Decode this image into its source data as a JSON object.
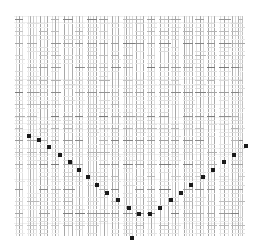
{
  "figure": {
    "title": "",
    "background_color": "#ffffff",
    "width": 255,
    "height": 250
  },
  "plot": {
    "left": 14,
    "top": 16,
    "width": 228,
    "height": 220,
    "grid": false,
    "axis_visible": false,
    "tick_labels_visible": false
  },
  "colors": {
    "background": "#ffffff",
    "marker": "#1a1a1a",
    "line_dark": "#8a8a8a",
    "line_mid": "#b4b4b4",
    "line_light": "#d8d8d8",
    "tick_dark": "#6e6e6e",
    "tick_mid": "#a8a8a8",
    "tick_light": "#d0d0d0"
  },
  "chart_data": {
    "type": "scatter",
    "title": "",
    "subtitle": "",
    "xlabel": "",
    "ylabel": "",
    "xlim": [
      0,
      228
    ],
    "ylim": [
      0,
      220
    ],
    "grid": false,
    "legend": null,
    "annotations": [],
    "background_columns": [
      {
        "x": 2,
        "lines": [
          0,
          3,
          6
        ],
        "weights": [
          0.35,
          0.9,
          0.3
        ]
      },
      {
        "x": 14,
        "lines": [
          0,
          2,
          5,
          8
        ],
        "weights": [
          0.25,
          0.8,
          0.5,
          0.3
        ]
      },
      {
        "x": 26,
        "lines": [
          0,
          4,
          7
        ],
        "weights": [
          0.9,
          0.35,
          0.85
        ]
      },
      {
        "x": 38,
        "lines": [
          0,
          3,
          6
        ],
        "weights": [
          0.3,
          0.85,
          0.3
        ]
      },
      {
        "x": 50,
        "lines": [
          0,
          4,
          8
        ],
        "weights": [
          0.85,
          0.4,
          0.8
        ]
      },
      {
        "x": 62,
        "lines": [
          0,
          3,
          6
        ],
        "weights": [
          0.3,
          0.85,
          0.35
        ]
      },
      {
        "x": 74,
        "lines": [
          0,
          2,
          5,
          8
        ],
        "weights": [
          0.8,
          0.3,
          0.5,
          0.85
        ]
      },
      {
        "x": 86,
        "lines": [
          0,
          4,
          7
        ],
        "weights": [
          0.3,
          0.85,
          0.3
        ]
      },
      {
        "x": 98,
        "lines": [
          0,
          3,
          6
        ],
        "weights": [
          0.85,
          0.35,
          0.8
        ]
      },
      {
        "x": 110,
        "lines": [
          0,
          2,
          5,
          8
        ],
        "weights": [
          0.3,
          0.85,
          0.4,
          0.35
        ]
      },
      {
        "x": 122,
        "lines": [
          0,
          4,
          7
        ],
        "weights": [
          0.85,
          0.3,
          0.85
        ]
      },
      {
        "x": 134,
        "lines": [
          0,
          3,
          6
        ],
        "weights": [
          0.3,
          0.85,
          0.3
        ]
      },
      {
        "x": 146,
        "lines": [
          0,
          4,
          8
        ],
        "weights": [
          0.8,
          0.35,
          0.85
        ]
      },
      {
        "x": 158,
        "lines": [
          0,
          3,
          6
        ],
        "weights": [
          0.35,
          0.85,
          0.3
        ]
      },
      {
        "x": 170,
        "lines": [
          0,
          2,
          5,
          8
        ],
        "weights": [
          0.85,
          0.3,
          0.5,
          0.8
        ]
      },
      {
        "x": 182,
        "lines": [
          0,
          4,
          7
        ],
        "weights": [
          0.3,
          0.9,
          0.35
        ]
      },
      {
        "x": 194,
        "lines": [
          0,
          3,
          6
        ],
        "weights": [
          0.85,
          0.3,
          0.85
        ]
      },
      {
        "x": 206,
        "lines": [
          0,
          4,
          8
        ],
        "weights": [
          0.3,
          0.85,
          0.3
        ]
      },
      {
        "x": 218,
        "lines": [
          0,
          3,
          6
        ],
        "weights": [
          0.8,
          0.35,
          0.8
        ]
      },
      {
        "x": 226,
        "lines": [
          0,
          2
        ],
        "weights": [
          0.3,
          0.6
        ]
      }
    ],
    "markers": [
      {
        "x": 45,
        "y": 348
      },
      {
        "x": 75,
        "y": 362
      },
      {
        "x": 105,
        "y": 382
      },
      {
        "x": 137,
        "y": 404
      },
      {
        "x": 167,
        "y": 424
      },
      {
        "x": 196,
        "y": 448
      },
      {
        "x": 222,
        "y": 470
      },
      {
        "x": 249,
        "y": 494
      },
      {
        "x": 278,
        "y": 516
      },
      {
        "x": 311,
        "y": 538
      },
      {
        "x": 345,
        "y": 560
      },
      {
        "x": 376,
        "y": 578
      },
      {
        "x": 407,
        "y": 578
      },
      {
        "x": 438,
        "y": 560
      },
      {
        "x": 470,
        "y": 538
      },
      {
        "x": 500,
        "y": 516
      },
      {
        "x": 530,
        "y": 494
      },
      {
        "x": 566,
        "y": 470
      },
      {
        "x": 597,
        "y": 448
      },
      {
        "x": 630,
        "y": 424
      },
      {
        "x": 660,
        "y": 404
      },
      {
        "x": 695,
        "y": 378
      }
    ],
    "marker_points_px": [
      [
        15,
        120
      ],
      [
        25,
        124
      ],
      [
        35,
        131
      ],
      [
        46,
        139
      ],
      [
        56,
        146
      ],
      [
        65,
        154
      ],
      [
        74,
        161
      ],
      [
        83,
        169
      ],
      [
        93,
        177
      ],
      [
        104,
        184
      ],
      [
        115,
        192
      ],
      [
        125,
        198
      ],
      [
        136,
        198
      ],
      [
        146,
        192
      ],
      [
        157,
        184
      ],
      [
        167,
        177
      ],
      [
        177,
        169
      ],
      [
        189,
        161
      ],
      [
        199,
        154
      ],
      [
        210,
        146
      ],
      [
        220,
        139
      ],
      [
        232,
        130
      ]
    ],
    "marker_size_px": 4,
    "marker_shape": "square",
    "marker_color": "#1a1a1a",
    "extra_markers_px": [
      [
        118,
        222
      ]
    ]
  }
}
